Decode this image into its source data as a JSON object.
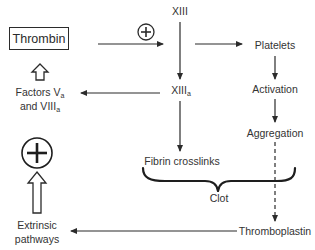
{
  "diagram": {
    "nodes": {
      "thrombin": {
        "label": "Thrombin",
        "boxed": true
      },
      "xiii": {
        "label": "XIII"
      },
      "xiiia": {
        "label": "XIII",
        "subscript": "a"
      },
      "platelets": {
        "label": "Platelets"
      },
      "activation": {
        "label": "Activation"
      },
      "aggregation": {
        "label": "Aggregation"
      },
      "factors_line1": {
        "label": "Factors V",
        "subscript": "a"
      },
      "factors_line2": {
        "label": "and VIII",
        "subscript": "a"
      },
      "fibrin": {
        "label": "Fibrin crosslinks"
      },
      "clot": {
        "label": "Clot"
      },
      "thromboplastin": {
        "label": "Thromboplastin"
      },
      "extrinsic_line1": {
        "label": "Extrinsic"
      },
      "extrinsic_line2": {
        "label": "pathways"
      }
    },
    "symbols": {
      "positive_small": "+",
      "positive_large": "+"
    },
    "edges": [
      {
        "from": "Thrombin",
        "to": "XIII axis",
        "style": "solid",
        "annotation": "positive"
      },
      {
        "from": "XIII",
        "to": "XIIIa",
        "style": "solid"
      },
      {
        "from": "XIII axis",
        "to": "Platelets",
        "style": "solid"
      },
      {
        "from": "XIIIa",
        "to": "Factors Va and VIIIa",
        "style": "solid"
      },
      {
        "from": "Factors Va and VIIIa",
        "to": "Thrombin",
        "style": "hollow-arrow"
      },
      {
        "from": "XIIIa",
        "to": "Fibrin crosslinks",
        "style": "solid"
      },
      {
        "from": "Platelets",
        "to": "Activation",
        "style": "solid"
      },
      {
        "from": "Activation",
        "to": "Aggregation",
        "style": "solid"
      },
      {
        "from": "Aggregation",
        "to": "Thromboplastin",
        "style": "dashed"
      },
      {
        "from": "Thromboplastin",
        "to": "Extrinsic pathways",
        "style": "solid"
      },
      {
        "from": "Extrinsic pathways",
        "to": "positive symbol",
        "style": "hollow-arrow"
      }
    ],
    "grouping": {
      "label": "Clot",
      "groups": [
        "Fibrin crosslinks",
        "Aggregation"
      ],
      "style": "curly-brace"
    },
    "colors": {
      "line": "#2b2b2b",
      "text": "#333333",
      "background": "#ffffff"
    }
  }
}
